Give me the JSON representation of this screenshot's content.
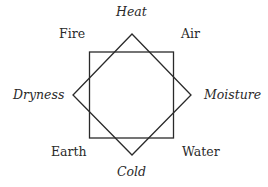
{
  "diagram": {
    "elements": {
      "fire": "Fire",
      "air": "Air",
      "earth": "Earth",
      "water": "Water"
    },
    "qualities": {
      "heat": "Heat",
      "cold": "Cold",
      "dryness": "Dryness",
      "moisture": "Moisture"
    },
    "colors": {
      "line": "#2a2a2a",
      "text": "#2a2a2a",
      "background": "#ffffff"
    }
  }
}
